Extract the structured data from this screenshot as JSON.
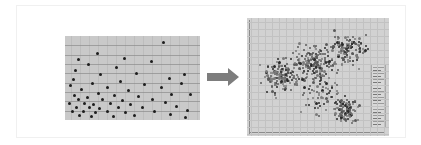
{
  "figure": {
    "title": "",
    "arrow": {
      "icon": "right-arrow-icon",
      "color": "#7d7d7d",
      "direction": "right"
    },
    "frame_color": "#f0f0f0",
    "background": "#ffffff"
  },
  "chart_data": [
    {
      "type": "scatter",
      "title": "",
      "xlabel": "",
      "ylabel": "",
      "xlim": [
        0,
        135
      ],
      "ylim": [
        0,
        84
      ],
      "grid": "horizontal",
      "gridline_count": 8,
      "plot_background": "#c9c9c9",
      "point_color": "#1d1d1d",
      "point_count": 58,
      "legend": "none",
      "points": [
        [
          97,
          5
        ],
        [
          31,
          16
        ],
        [
          115,
          46
        ],
        [
          12,
          22
        ],
        [
          58,
          21
        ],
        [
          22,
          27
        ],
        [
          50,
          30
        ],
        [
          9,
          33
        ],
        [
          85,
          24
        ],
        [
          34,
          37
        ],
        [
          7,
          42
        ],
        [
          70,
          36
        ],
        [
          103,
          41
        ],
        [
          54,
          44
        ],
        [
          26,
          46
        ],
        [
          4,
          48
        ],
        [
          41,
          50
        ],
        [
          78,
          47
        ],
        [
          118,
          37
        ],
        [
          15,
          52
        ],
        [
          62,
          53
        ],
        [
          95,
          50
        ],
        [
          32,
          56
        ],
        [
          48,
          58
        ],
        [
          8,
          58
        ],
        [
          21,
          60
        ],
        [
          72,
          59
        ],
        [
          105,
          57
        ],
        [
          12,
          62
        ],
        [
          36,
          62
        ],
        [
          56,
          63
        ],
        [
          86,
          62
        ],
        [
          124,
          57
        ],
        [
          3,
          66
        ],
        [
          18,
          66
        ],
        [
          27,
          67
        ],
        [
          44,
          66
        ],
        [
          64,
          67
        ],
        [
          99,
          65
        ],
        [
          10,
          70
        ],
        [
          23,
          70
        ],
        [
          33,
          71
        ],
        [
          52,
          70
        ],
        [
          76,
          70
        ],
        [
          110,
          69
        ],
        [
          6,
          74
        ],
        [
          17,
          74
        ],
        [
          29,
          75
        ],
        [
          41,
          74
        ],
        [
          59,
          75
        ],
        [
          88,
          74
        ],
        [
          121,
          73
        ],
        [
          13,
          78
        ],
        [
          25,
          79
        ],
        [
          47,
          79
        ],
        [
          68,
          78
        ],
        [
          104,
          77
        ],
        [
          119,
          80
        ]
      ]
    },
    {
      "type": "scatter",
      "title": "",
      "xlabel": "",
      "ylabel": "",
      "xlim": [
        0,
        142
      ],
      "ylim": [
        0,
        118
      ],
      "grid": "both",
      "plot_background": "#d2d2d2",
      "point_color": "#4a4a4a",
      "point_count": 620,
      "legend": "vertical colorbar, right side (labels illegible at source resolution)",
      "clusters": [
        {
          "cx": 32,
          "cy": 58,
          "spread": 20,
          "n": 150
        },
        {
          "cx": 68,
          "cy": 45,
          "spread": 24,
          "n": 180
        },
        {
          "cx": 100,
          "cy": 30,
          "spread": 22,
          "n": 130
        },
        {
          "cx": 98,
          "cy": 92,
          "spread": 16,
          "n": 100
        },
        {
          "cx": 72,
          "cy": 78,
          "spread": 26,
          "n": 60
        }
      ]
    }
  ]
}
